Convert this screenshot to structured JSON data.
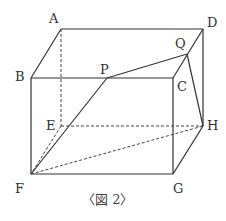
{
  "figure": {
    "caption": "〈図 2〉",
    "vertices": [
      {
        "name": "A",
        "x": 61,
        "y": 29
      },
      {
        "name": "B",
        "x": 31,
        "y": 78
      },
      {
        "name": "C",
        "x": 173,
        "y": 78
      },
      {
        "name": "D",
        "x": 203,
        "y": 29
      },
      {
        "name": "E",
        "x": 61,
        "y": 126
      },
      {
        "name": "F",
        "x": 31,
        "y": 174
      },
      {
        "name": "G",
        "x": 173,
        "y": 174
      },
      {
        "name": "H",
        "x": 203,
        "y": 126
      },
      {
        "name": "P",
        "x": 107,
        "y": 78
      },
      {
        "name": "Q",
        "x": 187,
        "y": 54
      }
    ],
    "labels": {
      "A": "A",
      "B": "B",
      "C": "C",
      "D": "D",
      "E": "E",
      "F": "F",
      "G": "G",
      "H": "H",
      "P": "P",
      "Q": "Q"
    },
    "solid_edges": [
      [
        "A",
        "D"
      ],
      [
        "A",
        "B"
      ],
      [
        "B",
        "C"
      ],
      [
        "C",
        "D"
      ],
      [
        "B",
        "F"
      ],
      [
        "C",
        "G"
      ],
      [
        "D",
        "H"
      ],
      [
        "F",
        "G"
      ],
      [
        "G",
        "H"
      ],
      [
        "P",
        "Q"
      ],
      [
        "P",
        "F"
      ],
      [
        "Q",
        "H"
      ]
    ],
    "dashed_edges": [
      [
        "A",
        "E"
      ],
      [
        "E",
        "H"
      ],
      [
        "E",
        "F"
      ],
      [
        "F",
        "H"
      ]
    ],
    "stroke_color": "#333333"
  }
}
